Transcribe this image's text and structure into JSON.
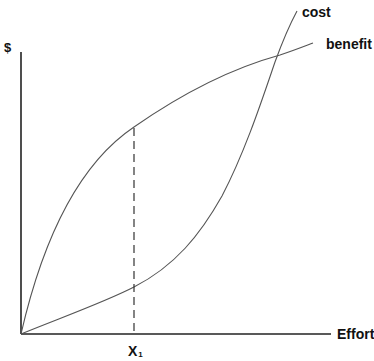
{
  "diagram": {
    "type": "cost-benefit curves",
    "y_axis_label": "$",
    "x_axis_label": "Effort",
    "marker_label": "X",
    "marker_subscript": "1",
    "curves": [
      {
        "name": "cost",
        "label": "cost",
        "shape": "convex, accelerating (slow rise then steep)"
      },
      {
        "name": "benefit",
        "label": "benefit",
        "shape": "concave, diminishing returns"
      }
    ],
    "annotations": [
      {
        "type": "dashed-vertical-line",
        "at": "X1",
        "from": "x-axis",
        "to": "benefit curve"
      }
    ],
    "colors": {
      "axis": "#222222",
      "curve": "#555555",
      "text": "#111111",
      "background": "#ffffff"
    }
  }
}
